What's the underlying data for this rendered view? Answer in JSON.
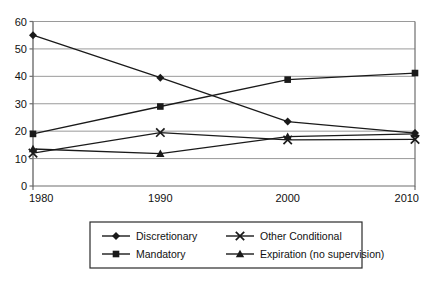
{
  "chart_data": {
    "type": "line",
    "title": "",
    "subtitle": "",
    "xlabel": "",
    "ylabel": "",
    "categories": [
      "1980",
      "1990",
      "2000",
      "2010"
    ],
    "x": [
      1980,
      1990,
      2000,
      2010
    ],
    "xlim": [
      1980,
      2010
    ],
    "ylim": [
      0,
      60
    ],
    "yticks": [
      0,
      10,
      20,
      30,
      40,
      50,
      60
    ],
    "xticks": [
      "1980",
      "1990",
      "2000",
      "2010"
    ],
    "grid": "horizontal",
    "legend_position": "bottom",
    "series": [
      {
        "name": "Discretionary",
        "marker": "diamond",
        "color": "#1a1a1a",
        "values": [
          55,
          39.5,
          23.5,
          19.3
        ]
      },
      {
        "name": "Mandatory",
        "marker": "square",
        "color": "#1a1a1a",
        "values": [
          19,
          29,
          38.8,
          41.2
        ]
      },
      {
        "name": "Other Conditional",
        "marker": "x",
        "color": "#1a1a1a",
        "values": [
          12,
          19.5,
          16.8,
          17
        ]
      },
      {
        "name": "Expiration (no supervision)",
        "marker": "triangle",
        "color": "#1a1a1a",
        "values": [
          13.5,
          11.8,
          18,
          19
        ]
      }
    ]
  },
  "axis": {
    "y_tick_labels": [
      "60",
      "50",
      "40",
      "30",
      "20",
      "10",
      "0"
    ],
    "x_tick_labels": [
      "1980",
      "1990",
      "2000",
      "2010"
    ]
  },
  "legend": {
    "entries": [
      {
        "label": "Discretionary",
        "marker": "diamond"
      },
      {
        "label": "Other Conditional",
        "marker": "x"
      },
      {
        "label": "Mandatory",
        "marker": "square"
      },
      {
        "label": "Expiration (no supervision)",
        "marker": "triangle"
      }
    ]
  },
  "colors": {
    "line": "#1a1a1a",
    "grid": "#9a9a9a",
    "axis": "#6e6e6e",
    "legend_border": "#2b2b2b",
    "background": "#ffffff"
  }
}
